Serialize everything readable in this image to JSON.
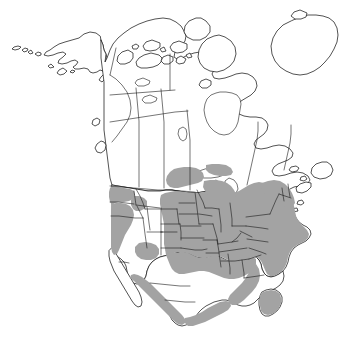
{
  "figure": {
    "kind": "species-range-map",
    "region": "North America",
    "title": "",
    "caption": "",
    "width_px": 363,
    "height_px": 349,
    "background_color": "#ffffff"
  },
  "legend": {
    "present": false,
    "entries": [
      {
        "key": "shaded",
        "label": "",
        "color": "#a3a3a3",
        "meaning": "range / distribution"
      },
      {
        "key": "unshaded",
        "label": "",
        "color": "#ffffff",
        "meaning": "outside range"
      }
    ]
  },
  "styling": {
    "shade_color": "#a3a3a3",
    "land_fill": "#ffffff",
    "outline_color": "#1a1a1a",
    "outline_width": 0.75,
    "subdivision_width": 0.6
  },
  "map_content": {
    "labels_visible": [],
    "graticule": false,
    "scale_bar": false,
    "north_arrow": false,
    "landmasses": [
      "Alaska",
      "Canada mainland",
      "Canadian Arctic Archipelago",
      "Greenland",
      "Contiguous United States",
      "Mexico",
      "Baja California peninsula",
      "Yucatan Peninsula",
      "Newfoundland",
      "Aleutian Islands"
    ],
    "water_bodies": [
      "Hudson Bay",
      "Great Lakes",
      "Gulf of Mexico",
      "Gulf of California"
    ],
    "subdivisions_drawn": [
      "United States state boundaries",
      "Canadian provincial boundaries"
    ],
    "shaded_regions": [
      "Eastern United States",
      "Midwestern United States",
      "Southeastern United States including Florida",
      "Texas and southern Great Plains",
      "Pacific coastal strip: Washington, Oregon, California",
      "Mexican Pacific coastal lowlands",
      "Mexican Gulf coastal lowlands",
      "Yucatan Peninsula",
      "Southern Great Lakes margin"
    ],
    "unshaded_regions": [
      "Alaska",
      "Canada",
      "Greenland",
      "Arctic Archipelago",
      "Great Basin and Intermountain West",
      "Northern Rocky Mountains",
      "Baja California",
      "Mexican Central Plateau",
      "Great Lakes water surfaces",
      "Canadian Maritimes"
    ]
  }
}
